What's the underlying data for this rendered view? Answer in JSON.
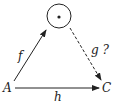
{
  "diagram": {
    "nodes": {
      "source": {
        "label": "A"
      },
      "target": {
        "label": "C"
      },
      "top": {
        "label": "",
        "shape": "circle-with-dot"
      }
    },
    "arrows": {
      "f": {
        "label": "f",
        "from": "A",
        "to": "top",
        "style": "solid"
      },
      "g": {
        "label": "g ?",
        "from": "top",
        "to": "C",
        "style": "dashed"
      },
      "h": {
        "label": "h",
        "from": "A",
        "to": "C",
        "style": "solid"
      }
    },
    "colors": {
      "stroke": "#222222",
      "background": "#ffffff"
    }
  }
}
